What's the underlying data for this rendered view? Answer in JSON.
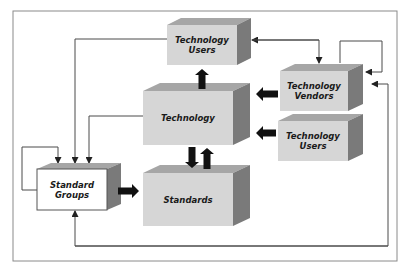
{
  "diagram": {
    "colors": {
      "frame": "#8a8a8a",
      "box_front": "#d6d6d6",
      "box_top": "#a6a6a6",
      "box_side": "#7a7a7a",
      "white_front": "#ffffff",
      "line": "#4a4a4a",
      "block_arrow": "#111111"
    },
    "nodes": [
      {
        "id": "tech-users-top",
        "lines": [
          "Technology",
          "Users"
        ]
      },
      {
        "id": "technology",
        "lines": [
          "Technology"
        ]
      },
      {
        "id": "tech-vendors",
        "lines": [
          "Technology",
          "Vendors"
        ]
      },
      {
        "id": "tech-users-right",
        "lines": [
          "Technology",
          "Users"
        ]
      },
      {
        "id": "standard-groups",
        "lines": [
          "Standard",
          "Groups"
        ]
      },
      {
        "id": "standards",
        "lines": [
          "Standards"
        ]
      }
    ],
    "block_arrows": [
      {
        "from": "technology",
        "to": "tech-users-top"
      },
      {
        "from": "tech-vendors",
        "to": "technology"
      },
      {
        "from": "tech-users-right",
        "to": "technology"
      },
      {
        "from": "technology",
        "to": "standards"
      },
      {
        "from": "standards",
        "to": "technology"
      },
      {
        "from": "standard-groups",
        "to": "standards"
      }
    ],
    "line_arrows": [
      {
        "from": "tech-users-top",
        "to": "standard-groups"
      },
      {
        "from": "technology",
        "to": "standard-groups"
      },
      {
        "from": "standard-groups",
        "to": "standard-groups"
      },
      {
        "from": "tech-users-top",
        "to": "tech-vendors",
        "bidirectional": true
      },
      {
        "from": "tech-vendors",
        "to": "tech-vendors"
      },
      {
        "from": "standard-groups",
        "to": "tech-vendors",
        "bidirectional": true
      }
    ]
  }
}
